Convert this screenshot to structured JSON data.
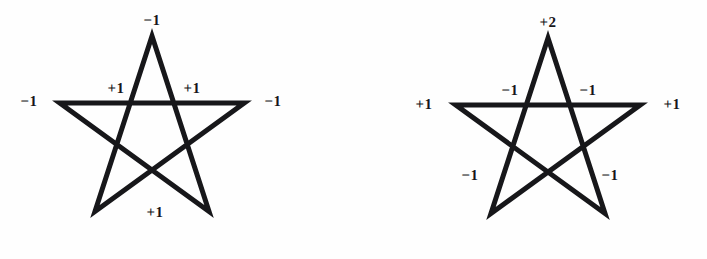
{
  "figure": {
    "background_color": "#fefefe",
    "ink_color": "#17171a",
    "stroke_width": 5
  },
  "stars": [
    {
      "id": "left-star",
      "name": "left-pentagram",
      "center": {
        "x": 152,
        "y": 133
      },
      "radius": 97,
      "labels": [
        {
          "name": "top-vertex-label",
          "text": "−1",
          "x": 152,
          "y": 21
        },
        {
          "name": "left-vertex-label",
          "text": "−1",
          "x": 29,
          "y": 102
        },
        {
          "name": "right-vertex-label",
          "text": "−1",
          "x": 273,
          "y": 102
        },
        {
          "name": "inner-left-label",
          "text": "+1",
          "x": 116,
          "y": 89
        },
        {
          "name": "inner-right-label",
          "text": "+1",
          "x": 192,
          "y": 89
        },
        {
          "name": "bottom-inner-label",
          "text": "+1",
          "x": 155,
          "y": 213
        }
      ]
    },
    {
      "id": "right-star",
      "name": "right-pentagram",
      "center": {
        "x": 548,
        "y": 135
      },
      "radius": 97,
      "labels": [
        {
          "name": "top-vertex-label",
          "text": "+2",
          "x": 548,
          "y": 23
        },
        {
          "name": "left-vertex-label",
          "text": "+1",
          "x": 424,
          "y": 105
        },
        {
          "name": "right-vertex-label",
          "text": "+1",
          "x": 672,
          "y": 105
        },
        {
          "name": "inner-top-left-label",
          "text": "−1",
          "x": 510,
          "y": 91
        },
        {
          "name": "inner-top-right-label",
          "text": "−1",
          "x": 588,
          "y": 91
        },
        {
          "name": "inner-lower-left-label",
          "text": "−1",
          "x": 470,
          "y": 176
        },
        {
          "name": "inner-lower-right-label",
          "text": "−1",
          "x": 610,
          "y": 176
        }
      ]
    }
  ]
}
